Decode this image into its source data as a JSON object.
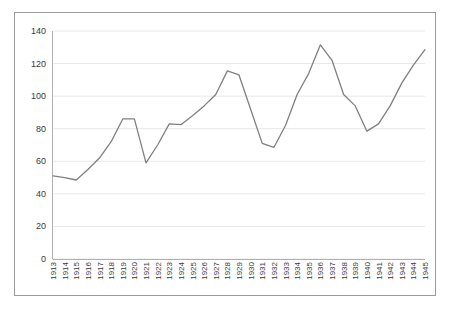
{
  "chart_data": {
    "type": "line",
    "title": "",
    "subtitle": "",
    "xlabel": "",
    "ylabel": "",
    "categories": [
      "1913",
      "1914",
      "1915",
      "1916",
      "1917",
      "1918",
      "1919",
      "1920",
      "1921",
      "1922",
      "1923",
      "1924",
      "1925",
      "1926",
      "1927",
      "1928",
      "1929",
      "1930",
      "1931",
      "1932",
      "1933",
      "1934",
      "1935",
      "1936",
      "1937",
      "1938",
      "1939",
      "1940",
      "1941",
      "1942",
      "1943",
      "1944",
      "1945"
    ],
    "values": [
      51,
      50,
      48.5,
      55,
      62,
      72,
      86,
      86,
      59,
      70,
      83,
      82.5,
      88,
      94,
      101,
      115.5,
      113,
      92,
      71,
      68.5,
      82,
      101,
      114,
      131.5,
      122,
      101,
      94,
      78.5,
      83,
      94,
      108,
      119,
      128.5
    ],
    "series": [
      {
        "name": "series-1",
        "values": [
          51,
          50,
          48.5,
          55,
          62,
          72,
          86,
          86,
          59,
          70,
          83,
          82.5,
          88,
          94,
          101,
          115.5,
          113,
          92,
          71,
          68.5,
          82,
          101,
          114,
          131.5,
          122,
          101,
          94,
          78.5,
          83,
          94,
          108,
          119,
          128.5
        ]
      }
    ],
    "ylim": [
      0,
      140
    ],
    "yticks": [
      0,
      20,
      40,
      60,
      80,
      100,
      120,
      140
    ],
    "ytick_labels": [
      "0",
      "20",
      "40",
      "60",
      "80",
      "100",
      "120",
      "140"
    ],
    "grid": true,
    "grid_axis": "y",
    "legend": false,
    "legend_position": "none",
    "line_color": "#808080",
    "grid_color": "#e8e8e8",
    "border_color": "#9a9a9a",
    "background_color": "#ffffff",
    "text_color": "#3a3a3a"
  }
}
